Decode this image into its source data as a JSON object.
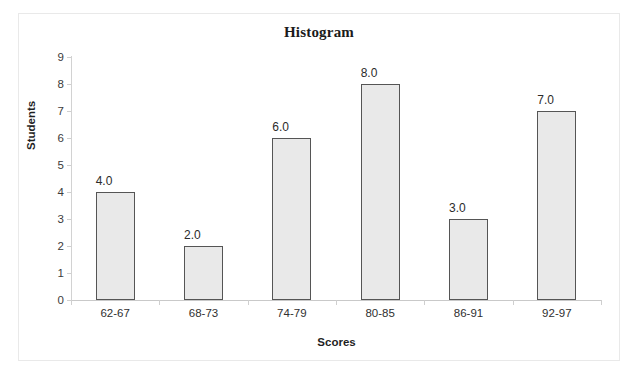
{
  "chart_data": {
    "type": "bar",
    "title": "Histogram",
    "xlabel": "Scores",
    "ylabel": "Students",
    "categories": [
      "62-67",
      "68-73",
      "74-79",
      "80-85",
      "86-91",
      "92-97"
    ],
    "values": [
      4,
      2,
      6,
      8,
      3,
      7
    ],
    "value_labels": [
      "4.0",
      "2.0",
      "6.0",
      "8.0",
      "3.0",
      "7.0"
    ],
    "ylim": [
      0,
      9
    ],
    "ytick_labels": [
      "9",
      "8",
      "7",
      "6",
      "5",
      "4",
      "3",
      "2",
      "1",
      "0"
    ],
    "ytick_values": [
      9,
      8,
      7,
      6,
      5,
      4,
      3,
      2,
      1,
      0
    ],
    "grid": false,
    "legend": "none",
    "bar_fill_color": "#e9e9e9",
    "bar_border_color": "#555555",
    "axis_line_color": "#cfcfcf",
    "text_color": "#1f1f1f"
  }
}
